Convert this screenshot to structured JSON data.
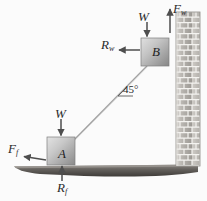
{
  "figure": {
    "background_color": "#fbfbfb",
    "width": 207,
    "height": 201
  },
  "bodies": {
    "block_a": {
      "label": "A",
      "name": "block-a",
      "x": 47,
      "y": 137,
      "size": 27,
      "fill_light": "#d9d9d9",
      "fill_dark": "#8e8e8e"
    },
    "block_b": {
      "label": "B",
      "name": "block-b",
      "x": 141,
      "y": 38,
      "size": 27,
      "fill_light": "#d6d6d6",
      "fill_dark": "#8b8b8b"
    }
  },
  "rod": {
    "name": "connecting-rod",
    "from_x": 74,
    "from_y": 140,
    "to_x": 146,
    "to_y": 66,
    "color": "#9a9a9a"
  },
  "angle": {
    "value": "45",
    "unit": "°",
    "text": "45°",
    "vertex_x": 122,
    "vertex_y": 92
  },
  "wall": {
    "name": "brick-wall",
    "x": 176,
    "y": 12,
    "width": 24,
    "height": 153,
    "brick_fill": "#b8b5b0",
    "mortar_color": "#f2f1ee",
    "rows": 14,
    "cols": 3
  },
  "ground": {
    "name": "ground-surface",
    "color_top": "#7a7672",
    "color_bottom": "#4a4744",
    "left_x": 14,
    "right_x": 200,
    "y": 166
  },
  "forces": [
    {
      "id": "W-B",
      "symbol": "W",
      "subscript": "",
      "text": "W",
      "direction": "down",
      "description": "weight of block B",
      "tail_x": 146,
      "tail_y": 20,
      "head_x": 146,
      "head_y": 37
    },
    {
      "id": "F-w",
      "symbol": "F",
      "subscript": "w",
      "text": "Fw",
      "direction": "up",
      "description": "friction force from wall on block B",
      "tail_x": 170,
      "tail_y": 32,
      "head_x": 170,
      "head_y": 8
    },
    {
      "id": "R-w",
      "symbol": "R",
      "subscript": "w",
      "text": "Rw",
      "direction": "left",
      "description": "normal reaction from wall on block B",
      "tail_x": 139,
      "tail_y": 50,
      "head_x": 118,
      "head_y": 50
    },
    {
      "id": "W-A",
      "symbol": "W",
      "subscript": "",
      "text": "W",
      "direction": "down",
      "description": "weight of block A",
      "tail_x": 60,
      "tail_y": 118,
      "head_x": 60,
      "head_y": 136
    },
    {
      "id": "F-f",
      "symbol": "F",
      "subscript": "f",
      "text": "Ff",
      "direction": "left",
      "description": "friction force from floor on block A",
      "tail_x": 44,
      "tail_y": 160,
      "head_x": 22,
      "head_y": 156
    },
    {
      "id": "R-f",
      "symbol": "R",
      "subscript": "f",
      "text": "Rf",
      "direction": "up",
      "description": "normal reaction from floor on block A",
      "tail_x": 62,
      "tail_y": 180,
      "head_x": 62,
      "head_y": 162
    }
  ],
  "labels": {
    "w_b": {
      "symbol": "W",
      "subscript": ""
    },
    "f_w": {
      "symbol": "F",
      "subscript": "w"
    },
    "r_w": {
      "symbol": "R",
      "subscript": "w"
    },
    "w_a": {
      "symbol": "W",
      "subscript": ""
    },
    "f_f": {
      "symbol": "F",
      "subscript": "f"
    },
    "r_f": {
      "symbol": "R",
      "subscript": "f"
    },
    "angle": "45°",
    "block_a": "A",
    "block_b": "B"
  },
  "colors": {
    "arrow": "#4e4e4e",
    "text": "#2b2b2b",
    "rod": "#9a9a9a",
    "wall_brick": "#b8b5b0",
    "ground_dark": "#4a4744"
  }
}
